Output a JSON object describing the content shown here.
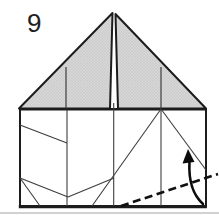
{
  "figure": {
    "step_label": "9",
    "kind": "origami-instruction-step",
    "shapes": {
      "roof": "two shaded triangular flaps meeting at a center apex",
      "base": "square paper panel with crease lines",
      "fold_line": "bold dashed valley-fold line rising to lower right edge",
      "arrow": "curved arrow indicating fold upward"
    }
  },
  "icons": {
    "fold_arrow": "curved-up-arrow"
  },
  "colors": {
    "background": "#ffffff",
    "shaded_flap": "#d7d7d7",
    "flap_texture": "#c4c4c4",
    "outline": "#1c1c1c",
    "crease": "#3d3d3d",
    "dashed_fold": "#101010",
    "arrow": "#0c0c0c",
    "scan_edge": "#c9c9c9"
  }
}
